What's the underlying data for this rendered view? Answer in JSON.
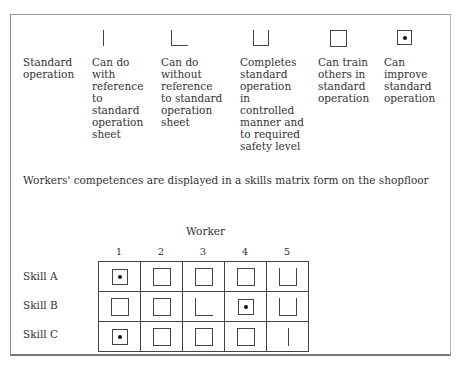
{
  "legend": [
    {
      "symbol": "bar",
      "label": "Standard operation",
      "show_symbol": false
    },
    {
      "symbol": "bar",
      "label": "Can do with reference to standard operation sheet"
    },
    {
      "symbol": "ell",
      "label": "Can do without reference to standard operation sheet"
    },
    {
      "symbol": "cup",
      "label": "Completes standard operation in controlled manner and to required safety level"
    },
    {
      "symbol": "box",
      "label": "Can train others in standard operation"
    },
    {
      "symbol": "dotbox",
      "label": "Can improve standard operation"
    }
  ],
  "legend_lines": {
    "c0": "Standard\noperation",
    "c1": "Can do\nwith\nreference\nto\nstandard\noperation\nsheet",
    "c2": "Can do\nwithout\nreference\nto standard\noperation\nsheet",
    "c3": "Completes\nstandard\noperation\nin\ncontrolled\nmanner and\nto required\nsafety level",
    "c4": "Can train\nothers in\nstandard\noperation",
    "c5": "Can improve\nstandard\noperation"
  },
  "caption": "Workers' competences are displayed in a skills matrix form on the shopfloor",
  "matrix": {
    "column_title": "Worker",
    "columns": [
      "1",
      "2",
      "3",
      "4",
      "5"
    ],
    "rows": [
      {
        "label": "Skill A",
        "cells": [
          "dotbox",
          "box",
          "box",
          "box",
          "cup"
        ]
      },
      {
        "label": "Skill B",
        "cells": [
          "box",
          "box",
          "ell",
          "dotbox",
          "cup"
        ]
      },
      {
        "label": "Skill C",
        "cells": [
          "dotbox",
          "box",
          "box",
          "box",
          "bar"
        ]
      }
    ]
  }
}
